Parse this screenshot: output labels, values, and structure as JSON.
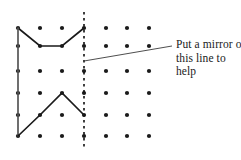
{
  "figure": {
    "type": "dot-grid-symmetry-puzzle",
    "canvas": {
      "width": 241,
      "height": 160
    },
    "grid": {
      "columns_x": [
        18,
        40,
        62,
        84,
        106,
        127,
        149
      ],
      "rows_y": [
        28,
        46,
        71,
        93,
        115,
        136
      ],
      "dot_radius": 2.1,
      "dot_color": "#1a1a1a",
      "rows": 6,
      "cols": 7
    },
    "mirror_line": {
      "label": "mirror-line",
      "x": 84,
      "y_start": 12,
      "y_end": 150,
      "style": "dashed",
      "color": "#111111",
      "dash": "2.5 3.5",
      "width": 1.6
    },
    "shapes": [
      {
        "name": "upper-zigzag",
        "points": "18,28 40,46 62,46 84,28",
        "color": "#1a1a1a",
        "width": 1.7
      },
      {
        "name": "left-vertical-edge",
        "points": "18,28 18,136",
        "color": "#555555",
        "width": 1.7
      },
      {
        "name": "lower-zigzag",
        "points": "18,136 40,115 62,93 84,115",
        "color": "#1a1a1a",
        "width": 1.7
      }
    ],
    "leader_line": {
      "name": "callout-leader-line",
      "points": "84,61 172,46",
      "color": "#3a3a3a",
      "width": 0.9
    }
  },
  "annotation": {
    "name": "mirror-instruction",
    "lines": [
      "Put a mirror on",
      "this line to",
      "help"
    ],
    "full_text": "Put a mirror on this line to help"
  }
}
